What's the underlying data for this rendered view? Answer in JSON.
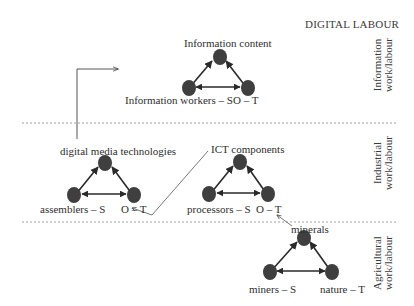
{
  "title": "DIGITAL LABOUR",
  "colors": {
    "node": "#3f3f3f",
    "line": "#2a2a2a",
    "divider": "#8a8a8a",
    "text": "#333333"
  },
  "layers": [
    {
      "id": "information",
      "label_line1": "Information",
      "label_line2": "work/labour"
    },
    {
      "id": "industrial",
      "label_line1": "Industrial",
      "label_line2": "work/labour"
    },
    {
      "id": "agricultural",
      "label_line1": "Agricultural",
      "label_line2": "work/labour"
    }
  ],
  "triangles": [
    {
      "id": "information",
      "top_label": "Information content",
      "subject_label": "Information workers – S",
      "ot_label": "O – T"
    },
    {
      "id": "industrial-assembly",
      "top_label": "digital media technologies",
      "subject_label": "assemblers – S",
      "ot_label": "O – T"
    },
    {
      "id": "industrial-processing",
      "top_label": "ICT components",
      "subject_label": "processors – S",
      "ot_label": "O – T"
    },
    {
      "id": "agricultural",
      "top_label": "minerals",
      "subject_label": "miners – S",
      "ot_label": "nature – T"
    }
  ]
}
